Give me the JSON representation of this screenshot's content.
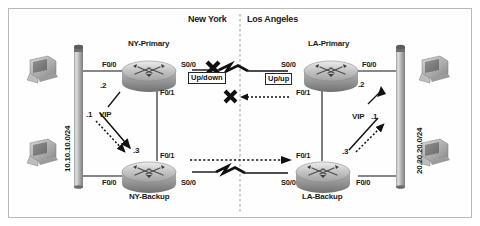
{
  "figure": {
    "border_color": "#b9b9b9",
    "background": "#ffffff",
    "line_color": "#111111",
    "divider_color": "#9a9a9a"
  },
  "sites": {
    "left": {
      "name": "New York",
      "subnet_label": "10.10.10.0/24",
      "routers": [
        {
          "id": "ny-primary",
          "name": "NY-Primary",
          "lan_interface": "F0/0",
          "wan_interface": "S0/0",
          "sync_interface": "F0/1",
          "host_octet": ".2"
        },
        {
          "id": "ny-backup",
          "name": "NY-Backup",
          "lan_interface": "F0/0",
          "wan_interface": "S0/0",
          "sync_interface": "F0/1",
          "host_octet": ".3"
        }
      ],
      "vip_label": "VIP",
      "vip_octet": ".1",
      "wan_status": "Up/down"
    },
    "right": {
      "name": "Los Angeles",
      "subnet_label": "20.20.20.0/24",
      "routers": [
        {
          "id": "la-primary",
          "name": "LA-Primary",
          "lan_interface": "F0/0",
          "wan_interface": "S0/0",
          "sync_interface": "F0/1",
          "host_octet": ".2"
        },
        {
          "id": "la-backup",
          "name": "LA-Backup",
          "lan_interface": "F0/0",
          "wan_interface": "S0/0",
          "sync_interface": "F0/1",
          "host_octet": ".3"
        }
      ],
      "vip_label": "VIP",
      "vip_octet": ".1",
      "wan_status": "Up/up"
    }
  },
  "links": {
    "primary_wan": {
      "type": "serial",
      "state": "failed",
      "failure_marker": "x-mark"
    },
    "primary_tracking": {
      "type": "dotted",
      "state": "failed",
      "failure_marker": "x-mark"
    },
    "backup_wan": {
      "type": "serial",
      "state": "active"
    },
    "backup_tracking": {
      "type": "dotted",
      "state": "active"
    }
  },
  "icons": {
    "workstation": "workstation-icon",
    "router": "router-icon",
    "segment": "network-segment-icon",
    "serial_break": "lightning-bolt-icon",
    "x_mark": "x-fail-icon"
  }
}
